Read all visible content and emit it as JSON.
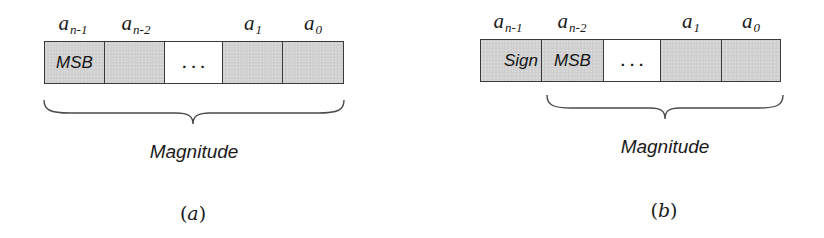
{
  "panels": [
    {
      "id": "a",
      "caption_open": "(",
      "caption_letter": "a",
      "caption_close": ")",
      "bit_labels": [
        {
          "base": "a",
          "sub": "n-1"
        },
        {
          "base": "a",
          "sub": "n-2"
        },
        {
          "base": "a",
          "sub": "1"
        },
        {
          "base": "a",
          "sub": "0"
        }
      ],
      "cells": [
        {
          "text": "MSB",
          "shaded": true
        },
        {
          "text": "",
          "shaded": true
        },
        {
          "text": "...",
          "shaded": false
        },
        {
          "text": "",
          "shaded": true
        },
        {
          "text": "",
          "shaded": true
        }
      ],
      "brace_label": "Magnitude"
    },
    {
      "id": "b",
      "caption_open": "(",
      "caption_letter": "b",
      "caption_close": ")",
      "bit_labels": [
        {
          "base": "a",
          "sub": "n-1"
        },
        {
          "base": "a",
          "sub": "n-2"
        },
        {
          "base": "a",
          "sub": "1"
        },
        {
          "base": "a",
          "sub": "0"
        }
      ],
      "cells": [
        {
          "text": "Sign",
          "shaded": true
        },
        {
          "text": "MSB",
          "shaded": true
        },
        {
          "text": "...",
          "shaded": false
        },
        {
          "text": "",
          "shaded": true
        },
        {
          "text": "",
          "shaded": true
        }
      ],
      "brace_label": "Magnitude"
    }
  ],
  "colors": {
    "cell_fill": "#d2d2d2",
    "blank_cell_fill": "#ffffff",
    "stroke": "#3a3a3a",
    "text": "#1a1a1a"
  }
}
